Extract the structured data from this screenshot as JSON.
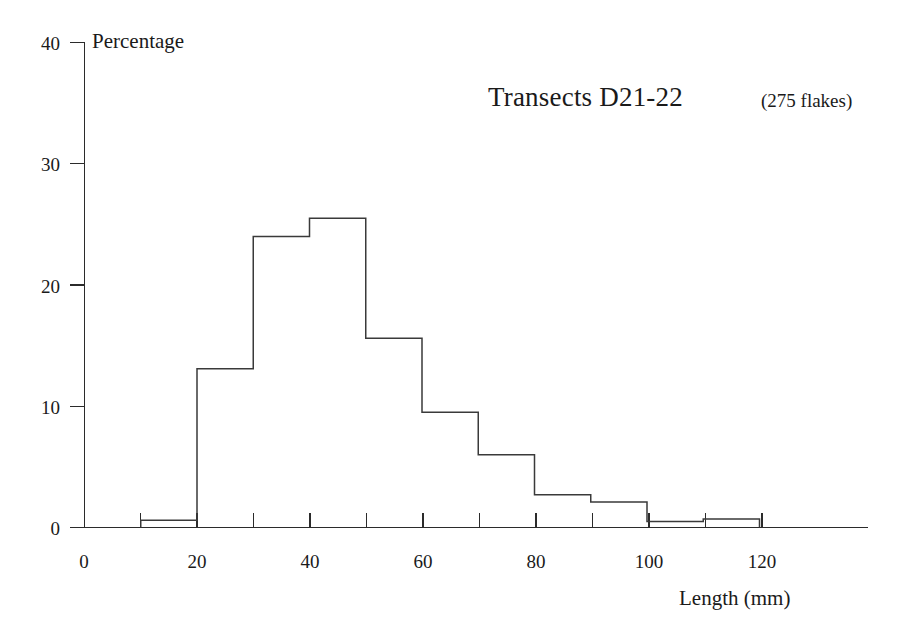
{
  "chart_data": {
    "type": "bar",
    "title": "Transects D21-22",
    "subtitle": "(275 flakes)",
    "xlabel": "Length  (mm)",
    "ylabel": "Percentage",
    "xlim": [
      0,
      140
    ],
    "ylim": [
      0,
      40
    ],
    "grid": false,
    "legend": null,
    "bin_width": 10,
    "bin_edges": [
      0,
      10,
      20,
      30,
      40,
      50,
      60,
      70,
      80,
      90,
      100,
      110,
      120
    ],
    "categories": [
      "0-10",
      "10-20",
      "20-30",
      "30-40",
      "40-50",
      "50-60",
      "60-70",
      "70-80",
      "80-90",
      "90-100",
      "100-110",
      "110-120"
    ],
    "values": [
      0,
      0.6,
      13.1,
      24.0,
      25.5,
      15.6,
      9.5,
      6.0,
      2.7,
      2.1,
      0.5,
      0.7
    ],
    "x_ticks": [
      0,
      10,
      20,
      30,
      40,
      50,
      60,
      70,
      80,
      90,
      100,
      110,
      120
    ],
    "x_tick_labels": [
      "0",
      "",
      "20",
      "",
      "40",
      "",
      "60",
      "",
      "80",
      "",
      "100",
      "",
      "120"
    ],
    "y_ticks": [
      0,
      10,
      20,
      30,
      40
    ],
    "y_tick_labels": [
      "0",
      "10",
      "20",
      "30",
      "40"
    ],
    "colors": {
      "bar_stroke": "#3a3a3a",
      "bar_fill": "none",
      "axis": "#2b2b2b",
      "text": "#1a1a1a",
      "background": "#ffffff"
    }
  },
  "axes": {
    "y_title": "Percentage",
    "x_title": "Length  (mm)"
  },
  "annotations": {
    "title": "Transects D21-22",
    "sample_size": "(275 flakes)"
  },
  "y_tick_labels": {
    "t0": "0",
    "t1": "10",
    "t2": "20",
    "t3": "30",
    "t4": "40"
  },
  "x_tick_labels": {
    "t0": "0",
    "t20": "20",
    "t40": "40",
    "t60": "60",
    "t80": "80",
    "t100": "100",
    "t120": "120"
  }
}
